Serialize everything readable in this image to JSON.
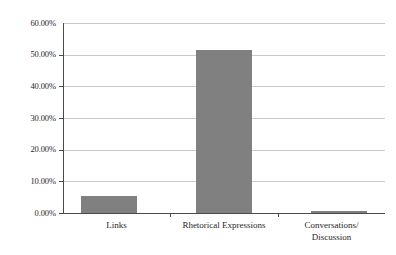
{
  "chart_data": {
    "type": "bar",
    "title": "",
    "subtitle": "",
    "xlabel": "",
    "ylabel": "",
    "categories": [
      "Links",
      "Rhetorical Expressions",
      "Conversations/\nDiscussion"
    ],
    "values": [
      5.5,
      51.5,
      0.6
    ],
    "value_labels": [
      "5.50%",
      "51.50%",
      "0.60%"
    ],
    "ylim": [
      0,
      60
    ],
    "ytick_values": [
      0,
      10,
      20,
      30,
      40,
      50,
      60
    ],
    "ytick_labels": [
      "0.00%",
      "10.00%",
      "20.00%",
      "30.00%",
      "40.00%",
      "50.00%",
      "60.00%"
    ],
    "grid": true,
    "legend": false,
    "legend_position": "none",
    "series": [
      {
        "name": "Percentage",
        "values": [
          5.5,
          51.5,
          0.6
        ]
      }
    ]
  },
  "style": {
    "bar_color": "#808080",
    "gridline_color": "#c9c9c9",
    "axis_color": "#4a4a4a",
    "text_color": "#1f1f1f",
    "background_color": "#ffffff"
  }
}
